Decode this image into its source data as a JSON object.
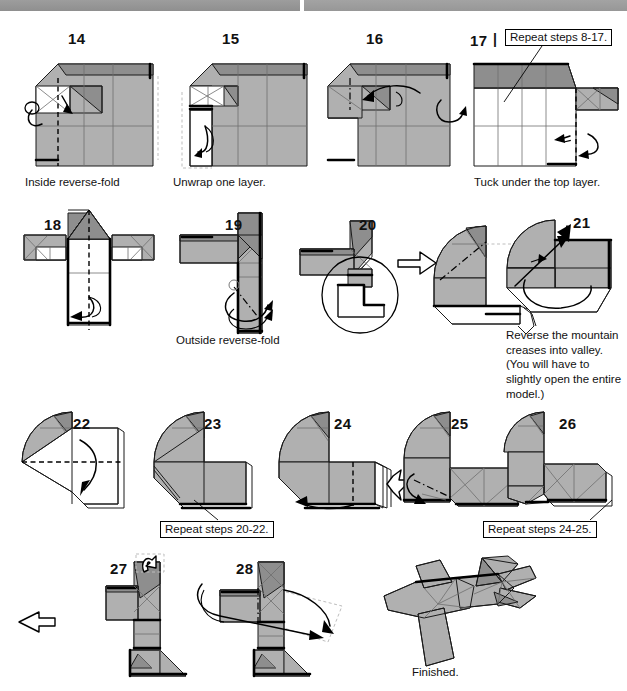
{
  "page": {
    "background": "#ffffff",
    "paper_front_color": "#b0b0b0",
    "paper_back_color": "#ffffff",
    "paper_shadow_color": "#8e8e8e",
    "line_color": "#1a1a1a",
    "width": 627,
    "height": 691
  },
  "steps": [
    {
      "number": "14",
      "caption": "Inside reverse-fold"
    },
    {
      "number": "15",
      "caption": "Unwrap one layer."
    },
    {
      "number": "16",
      "caption": ""
    },
    {
      "number": "17",
      "caption": "Tuck under the top layer.",
      "turnover_symbol": "|"
    },
    {
      "number": "18",
      "caption": ""
    },
    {
      "number": "19",
      "caption": "Outside reverse-fold"
    },
    {
      "number": "20",
      "caption": ""
    },
    {
      "number": "21",
      "caption": "Reverse the mountain creases into valley. (You will have to slightly open the entire model.)"
    },
    {
      "number": "22",
      "caption": ""
    },
    {
      "number": "23",
      "caption": ""
    },
    {
      "number": "24",
      "caption": ""
    },
    {
      "number": "25",
      "caption": ""
    },
    {
      "number": "26",
      "caption": ""
    },
    {
      "number": "27",
      "caption": ""
    },
    {
      "number": "28",
      "caption": ""
    }
  ],
  "callouts": [
    {
      "id": "repeat-8-17",
      "text": "Repeat steps 8-17."
    },
    {
      "id": "repeat-20-22",
      "text": "Repeat steps 20-22."
    },
    {
      "id": "repeat-24-25",
      "text": "Repeat steps 24-25."
    }
  ],
  "final": {
    "caption": "Finished."
  },
  "symbols": {
    "turn_over_arrow": "turn-over-arrow",
    "push_arrow": "push-in-arrow",
    "open_arrow": "hollow-open-arrow",
    "valley_fold": "valley-fold-dashed-line",
    "mountain_fold": "mountain-fold-dash-dot-line",
    "magnifier": "magnifier-circle",
    "view_change_arrow": "hollow-view-change-arrow"
  }
}
